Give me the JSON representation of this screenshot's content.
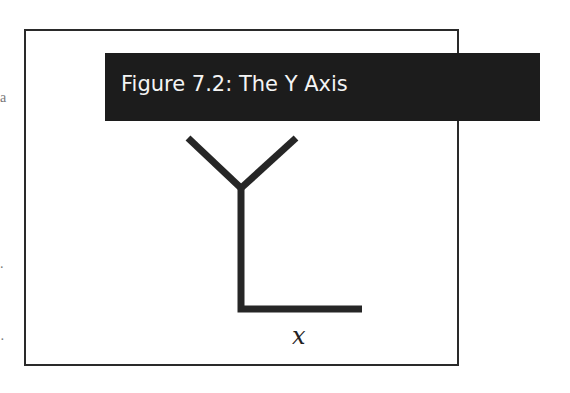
{
  "figure": {
    "title": "Figure 7.2: The Y Axis",
    "axis_label": "x",
    "colors": {
      "banner_bg": "#1c1c1c",
      "banner_text": "#f4f4f4",
      "stroke": "#2a2a2a",
      "background": "#ffffff"
    }
  },
  "margin_fragments": [
    "a",
    ".",
    "·"
  ]
}
